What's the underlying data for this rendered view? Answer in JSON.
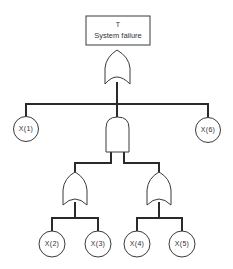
{
  "diagram": {
    "type": "fault-tree",
    "top_event": {
      "id": "T",
      "label": "System failure"
    },
    "gates": [
      {
        "name": "top-or-gate",
        "type": "OR"
      },
      {
        "name": "middle-and-gate",
        "type": "AND"
      },
      {
        "name": "left-or-gate",
        "type": "OR"
      },
      {
        "name": "right-or-gate",
        "type": "OR"
      }
    ],
    "basic_events": [
      {
        "id": "x1",
        "label": "X(1)"
      },
      {
        "id": "x2",
        "label": "X(2)"
      },
      {
        "id": "x3",
        "label": "X(3)"
      },
      {
        "id": "x4",
        "label": "X(4)"
      },
      {
        "id": "x5",
        "label": "X(5)"
      },
      {
        "id": "x6",
        "label": "X(6)"
      }
    ],
    "structure": "T = OR( X(1), AND( OR(X(2), X(3)), OR(X(4), X(5)) ), X(6) )",
    "colors": {
      "line": "#2a2a2a",
      "background": "#ffffff",
      "text": "#333333"
    }
  }
}
